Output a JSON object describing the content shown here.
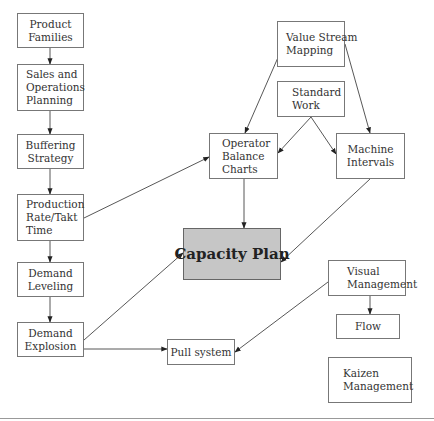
{
  "nodes": {
    "product_families": [
      "Product",
      "Families"
    ],
    "sales_ops_planning": [
      "Sales and",
      "Operations",
      "Planning"
    ],
    "buffering_strategy": [
      "Buffering",
      "Strategy"
    ],
    "production_rate": [
      "Production",
      "Rate/Takt",
      "Time"
    ],
    "demand_leveling": [
      "Demand",
      "Leveling"
    ],
    "demand_explosion": [
      "Demand",
      "Explosion"
    ],
    "value_stream_mapping": [
      "Value Stream",
      "Mapping"
    ],
    "standard_work": [
      "Standard",
      "Work"
    ],
    "operator_balance": [
      "Operator",
      "Balance",
      "Charts"
    ],
    "machine_intervals": [
      "Machine",
      "Intervals"
    ],
    "capacity_plan": [
      "Capacity Plan"
    ],
    "visual_management": [
      "Visual",
      "Management"
    ],
    "flow": [
      "Flow"
    ],
    "pull_system": [
      "Pull system"
    ],
    "kaizen_management": [
      "Kaizen",
      "Management"
    ]
  },
  "edges": [
    {
      "from": "product_families",
      "to": "sales_ops_planning"
    },
    {
      "from": "sales_ops_planning",
      "to": "buffering_strategy"
    },
    {
      "from": "buffering_strategy",
      "to": "production_rate"
    },
    {
      "from": "production_rate",
      "to": "demand_leveling"
    },
    {
      "from": "demand_leveling",
      "to": "demand_explosion"
    },
    {
      "from": "production_rate",
      "to": "operator_balance"
    },
    {
      "from": "value_stream_mapping",
      "to": "operator_balance"
    },
    {
      "from": "value_stream_mapping",
      "to": "machine_intervals"
    },
    {
      "from": "standard_work",
      "to": "operator_balance"
    },
    {
      "from": "standard_work",
      "to": "machine_intervals"
    },
    {
      "from": "operator_balance",
      "to": "capacity_plan"
    },
    {
      "from": "machine_intervals",
      "to": "capacity_plan"
    },
    {
      "from": "demand_explosion",
      "to": "capacity_plan"
    },
    {
      "from": "demand_explosion",
      "to": "pull_system"
    },
    {
      "from": "visual_management",
      "to": "pull_system"
    },
    {
      "from": "visual_management",
      "to": "flow"
    }
  ],
  "colors": {
    "line": "#444444",
    "border": "#777777",
    "capacity_fill": "#c6c6c6"
  }
}
